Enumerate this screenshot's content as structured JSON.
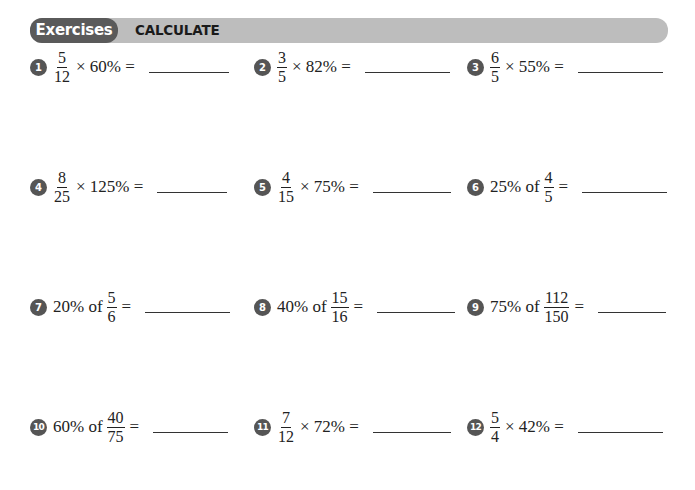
{
  "header": {
    "pill_label": "Exercises",
    "title": "CALCULATE"
  },
  "exercises": [
    {
      "number": "1",
      "prefix": "",
      "fraction": {
        "num": "5",
        "den": "12"
      },
      "suffix": "× 60% =",
      "answer": ""
    },
    {
      "number": "2",
      "prefix": "",
      "fraction": {
        "num": "3",
        "den": "5"
      },
      "suffix": "× 82% =",
      "answer": ""
    },
    {
      "number": "3",
      "prefix": "",
      "fraction": {
        "num": "6",
        "den": "5"
      },
      "suffix": "× 55% =",
      "answer": ""
    },
    {
      "number": "4",
      "prefix": "",
      "fraction": {
        "num": "8",
        "den": "25"
      },
      "suffix": "× 125% =",
      "answer": ""
    },
    {
      "number": "5",
      "prefix": "",
      "fraction": {
        "num": "4",
        "den": "15"
      },
      "suffix": "× 75% =",
      "answer": ""
    },
    {
      "number": "6",
      "prefix": "25% of",
      "fraction": {
        "num": "4",
        "den": "5"
      },
      "suffix": "=",
      "answer": ""
    },
    {
      "number": "7",
      "prefix": "20% of",
      "fraction": {
        "num": "5",
        "den": "6"
      },
      "suffix": "=",
      "answer": ""
    },
    {
      "number": "8",
      "prefix": "40% of",
      "fraction": {
        "num": "15",
        "den": "16"
      },
      "suffix": "=",
      "answer": ""
    },
    {
      "number": "9",
      "prefix": "75% of",
      "fraction": {
        "num": "112",
        "den": "150"
      },
      "suffix": "=",
      "answer": ""
    },
    {
      "number": "10",
      "prefix": "60% of",
      "fraction": {
        "num": "40",
        "den": "75"
      },
      "suffix": "=",
      "answer": ""
    },
    {
      "number": "11",
      "prefix": "",
      "fraction": {
        "num": "7",
        "den": "12"
      },
      "suffix": "× 72% =",
      "answer": ""
    },
    {
      "number": "12",
      "prefix": "",
      "fraction": {
        "num": "5",
        "den": "4"
      },
      "suffix": "× 42% =",
      "answer": ""
    }
  ]
}
